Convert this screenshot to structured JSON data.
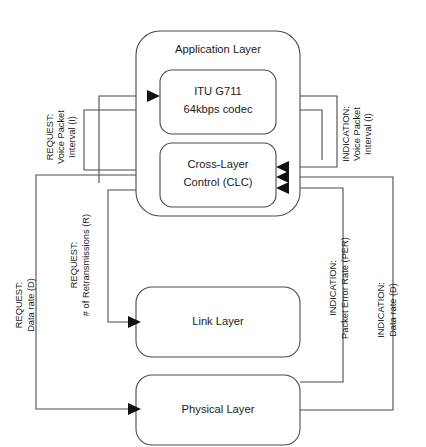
{
  "diagram": {
    "stroke_color": "#4a4a4a",
    "arrow_color": "#111111",
    "background_color": "#ffffff",
    "boxes": {
      "application_layer": "Application Layer",
      "codec_line1": "ITU G711",
      "codec_line2": "64kbps codec",
      "clc_line1": "Cross-Layer",
      "clc_line2": "Control (CLC)",
      "link_layer": "Link Layer",
      "physical_layer": "Physical Layer"
    },
    "edge_labels": {
      "request_interval": {
        "line1": "REQUEST:",
        "line2": "Voice Packet",
        "line3": "Interval (I)"
      },
      "indication_interval": {
        "line1": "INDICATION:",
        "line2": "Voice Packet",
        "line3": "Interval (I)"
      },
      "request_data_rate": {
        "line1": "REQUEST:",
        "line2": "Data rate (D)"
      },
      "request_retransmissions": {
        "line1": "REQUEST:",
        "line2": "# of Retransmissions (R)"
      },
      "indication_per": {
        "line1": "INDICATION:",
        "line2": "Packet Error Rate (PER)"
      },
      "indication_data_rate": {
        "line1": "INDICATION:",
        "line2": "Data rate (D)"
      }
    }
  }
}
